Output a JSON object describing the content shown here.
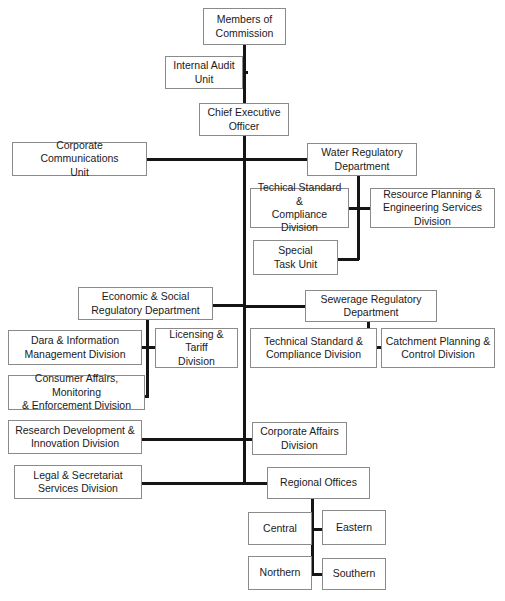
{
  "chart_title": "Organisational Structure Chart",
  "canvas": {
    "width": 505,
    "height": 601,
    "background": "#ffffff"
  },
  "style": {
    "box_border_color": "#8a8a8a",
    "connector_color": "#151515",
    "text_color": "#1a1a1a"
  },
  "nodes": {
    "members_of_commission": {
      "label": "Members of\nCommission",
      "x": 203,
      "y": 8,
      "w": 83,
      "h": 37
    },
    "internal_audit_unit": {
      "label": "Internal Audit\nUnit",
      "x": 165,
      "y": 56,
      "w": 78,
      "h": 33
    },
    "chief_executive_officer": {
      "label": "Chief Executive\nOfficer",
      "x": 199,
      "y": 103,
      "w": 90,
      "h": 33
    },
    "corporate_communications_unit": {
      "label": "Corporate Communications\nUnit",
      "x": 12,
      "y": 142,
      "w": 135,
      "h": 34
    },
    "water_regulatory_department": {
      "label": "Water Regulatory\nDepartment",
      "x": 307,
      "y": 143,
      "w": 110,
      "h": 33
    },
    "techical_standard_compliance_division_water": {
      "label": "Techical Standard &\nCompliance Division",
      "x": 250,
      "y": 188,
      "w": 99,
      "h": 40
    },
    "resource_planning_engineering_services_division": {
      "label": "Resource Planning &\nEngineering Services Division",
      "x": 370,
      "y": 188,
      "w": 125,
      "h": 40
    },
    "special_task_unit": {
      "label": "Special\nTask Unit",
      "x": 253,
      "y": 240,
      "w": 85,
      "h": 35
    },
    "economic_social_regulatory_department": {
      "label": "Economic & Social\nRegulatory Department",
      "x": 78,
      "y": 287,
      "w": 135,
      "h": 33
    },
    "sewerage_regulatory_department": {
      "label": "Sewerage Regulatory\nDepartment",
      "x": 305,
      "y": 290,
      "w": 132,
      "h": 32
    },
    "dara_information_management_division": {
      "label": "Dara & Information\nManagement Division",
      "x": 8,
      "y": 330,
      "w": 134,
      "h": 35
    },
    "licensing_tariff_division": {
      "label": "Licensing & Tariff\nDivision",
      "x": 155,
      "y": 328,
      "w": 83,
      "h": 40
    },
    "technical_standard_compliance_division_sewerage": {
      "label": "Technical Standard &\nCompliance Division",
      "x": 250,
      "y": 328,
      "w": 127,
      "h": 40
    },
    "catchment_planning_control_division": {
      "label": "Catchment Planning &\nControl Division",
      "x": 381,
      "y": 328,
      "w": 114,
      "h": 40
    },
    "consumer_affairs_monitoring_enforcement_division": {
      "label": "Consumer Affairs, Monitoring\n& Enforcement Division",
      "x": 8,
      "y": 375,
      "w": 137,
      "h": 35
    },
    "research_development_innovation_division": {
      "label": "Research Development &\nInnovation Division",
      "x": 8,
      "y": 420,
      "w": 134,
      "h": 34
    },
    "corporate_affairs_division": {
      "label": "Corporate Affairs\nDivision",
      "x": 252,
      "y": 422,
      "w": 95,
      "h": 33
    },
    "legal_secretariat_services_division": {
      "label": "Legal & Secretariat\nServices Division",
      "x": 14,
      "y": 465,
      "w": 128,
      "h": 34
    },
    "regional_offices": {
      "label": "Regional Offices",
      "x": 267,
      "y": 467,
      "w": 103,
      "h": 32
    },
    "central": {
      "label": "Central",
      "x": 248,
      "y": 512,
      "w": 64,
      "h": 33
    },
    "eastern": {
      "label": "Eastern",
      "x": 322,
      "y": 510,
      "w": 64,
      "h": 35
    },
    "northern": {
      "label": "Northern",
      "x": 248,
      "y": 556,
      "w": 64,
      "h": 34
    },
    "southern": {
      "label": "Southern",
      "x": 322,
      "y": 558,
      "w": 64,
      "h": 32
    }
  },
  "connectors": [
    {
      "name": "commission-to-ceo-trunk",
      "orient": "v",
      "x": 243,
      "y": 45,
      "len": 58
    },
    {
      "name": "internal-audit-to-trunk",
      "orient": "h",
      "x": 243,
      "y": 71,
      "len": 5
    },
    {
      "name": "ceo-main-trunk",
      "orient": "v",
      "x": 243,
      "y": 136,
      "len": 349
    },
    {
      "name": "corporate-comms-to-water-dept",
      "orient": "h",
      "x": 147,
      "y": 158,
      "len": 160
    },
    {
      "name": "water-dept-stem",
      "orient": "v",
      "x": 357,
      "y": 176,
      "len": 84
    },
    {
      "name": "water-divisions-crossbar",
      "orient": "h",
      "x": 349,
      "y": 207,
      "len": 21
    },
    {
      "name": "special-task-to-water-stem",
      "orient": "h",
      "x": 338,
      "y": 258,
      "len": 21
    },
    {
      "name": "economic-dept-to-trunk",
      "orient": "h",
      "x": 213,
      "y": 304,
      "len": 32
    },
    {
      "name": "sewerage-dept-to-trunk",
      "orient": "h",
      "x": 243,
      "y": 305,
      "len": 62
    },
    {
      "name": "economic-dept-stem",
      "orient": "v",
      "x": 146,
      "y": 320,
      "len": 77
    },
    {
      "name": "economic-divisions-crossbar",
      "orient": "h",
      "x": 142,
      "y": 346,
      "len": 13
    },
    {
      "name": "consumer-affairs-to-stem",
      "orient": "h",
      "x": 145,
      "y": 395,
      "len": 4
    },
    {
      "name": "sewerage-dept-stem",
      "orient": "v",
      "x": 367,
      "y": 322,
      "len": 27
    },
    {
      "name": "sewerage-divisions-crossbar",
      "orient": "h",
      "x": 377,
      "y": 346,
      "len": 6
    },
    {
      "name": "research-dev-to-trunk",
      "orient": "h",
      "x": 142,
      "y": 438,
      "len": 103
    },
    {
      "name": "corporate-affairs-to-trunk",
      "orient": "h",
      "x": 243,
      "y": 438,
      "len": 11
    },
    {
      "name": "legal-secretariat-to-trunk",
      "orient": "h",
      "x": 142,
      "y": 482,
      "len": 103
    },
    {
      "name": "regional-offices-to-trunk",
      "orient": "h",
      "x": 243,
      "y": 482,
      "len": 26
    },
    {
      "name": "regional-offices-stem",
      "orient": "v",
      "x": 311,
      "y": 499,
      "len": 77
    },
    {
      "name": "central-eastern-crossbar",
      "orient": "h",
      "x": 310,
      "y": 528,
      "len": 14
    },
    {
      "name": "northern-southern-crossbar",
      "orient": "h",
      "x": 310,
      "y": 573,
      "len": 14
    }
  ]
}
